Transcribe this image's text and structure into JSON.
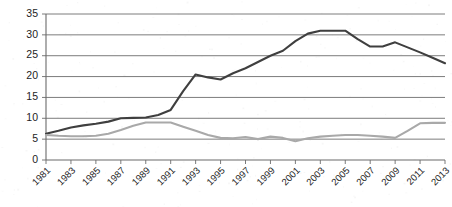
{
  "chart_data": {
    "type": "line",
    "title": "",
    "subtitle": "",
    "xlabel": "",
    "ylabel": "",
    "grid": true,
    "legend": "none",
    "xlim": [
      1981,
      2013
    ],
    "ylim": [
      0,
      35
    ],
    "ytick_step": 5,
    "xtick_step": 2,
    "ytick_labels": [
      "0",
      "5",
      "10",
      "15",
      "20",
      "25",
      "30",
      "35"
    ],
    "ytick_values": [
      0,
      5,
      10,
      15,
      20,
      25,
      30,
      35
    ],
    "xtick_labels": [
      "1981",
      "1983",
      "1985",
      "1987",
      "1989",
      "1991",
      "1993",
      "1995",
      "1997",
      "1999",
      "2001",
      "2003",
      "2005",
      "2007",
      "2009",
      "2011",
      "2013"
    ],
    "x": [
      1981,
      1982,
      1983,
      1984,
      1985,
      1986,
      1987,
      1988,
      1989,
      1990,
      1991,
      1992,
      1993,
      1994,
      1995,
      1996,
      1997,
      1998,
      1999,
      2000,
      2001,
      2002,
      2003,
      2004,
      2005,
      2006,
      2007,
      2008,
      2009,
      2010,
      2011,
      2012,
      2013
    ],
    "series": [
      {
        "name": "dark-series",
        "color": "#3f3f3f",
        "width": 2.1,
        "values": [
          6.3,
          7.0,
          7.8,
          8.3,
          8.7,
          9.2,
          10.0,
          10.1,
          10.2,
          10.8,
          12.0,
          16.5,
          20.5,
          19.8,
          19.3,
          20.8,
          22.0,
          23.5,
          25.0,
          26.2,
          28.5,
          30.3,
          31.0,
          31.0,
          31.0,
          29.0,
          27.2,
          27.2,
          28.2,
          27.0,
          25.8,
          24.5,
          23.2
        ]
      },
      {
        "name": "light-series",
        "color": "#a9a9a9",
        "width": 2.1,
        "values": [
          6.0,
          5.8,
          5.7,
          5.7,
          5.8,
          6.3,
          7.2,
          8.2,
          9.0,
          9.0,
          9.0,
          8.0,
          7.0,
          6.0,
          5.3,
          5.2,
          5.5,
          5.0,
          5.6,
          5.3,
          4.5,
          5.2,
          5.6,
          5.8,
          6.0,
          6.0,
          5.8,
          5.6,
          5.3,
          7.0,
          8.8,
          8.9,
          8.9
        ]
      }
    ]
  },
  "plot": {
    "left": 46,
    "right": 445,
    "top": 14,
    "bottom": 160,
    "xlabel_rotation": -45
  }
}
